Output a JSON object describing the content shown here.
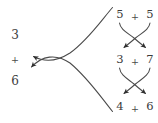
{
  "figure": {
    "type": "math-number-bond-diagram",
    "background_color": "#ffffff",
    "stroke_color": "#3b3b3b",
    "text_color": "#3b3b3b"
  },
  "left_expression": {
    "name": "result-sum",
    "top_addend": "3",
    "operator": "+",
    "bottom_addend": "6"
  },
  "right_column": {
    "rows": [
      {
        "name": "row-1",
        "left_term": "5",
        "operator": "+",
        "right_term": "5"
      },
      {
        "name": "row-2",
        "left_term": "3",
        "operator": "+",
        "right_term": "7"
      },
      {
        "name": "row-3",
        "left_term": "4",
        "operator": "+",
        "right_term": "6"
      }
    ],
    "crossings": [
      {
        "name": "crossing-1",
        "from_row": "row-1",
        "to_row": "row-2"
      },
      {
        "name": "crossing-2",
        "from_row": "row-2",
        "to_row": "row-3"
      }
    ]
  },
  "long_arrows": {
    "upper": {
      "name": "upper-long-arrow",
      "points_to": "3"
    },
    "lower": {
      "name": "lower-long-arrow",
      "points_to": "6"
    }
  }
}
